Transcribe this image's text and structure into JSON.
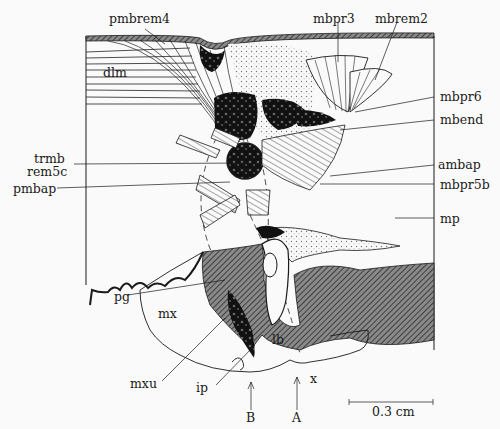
{
  "figure": {
    "type": "anatomical-diagram",
    "labels": {
      "pmbrem4": "pmbrem4",
      "mbpr3": "mbpr3",
      "mbrem2": "mbrem2",
      "dlm": "dlm",
      "mbpr6": "mbpr6",
      "mbend": "mbend",
      "trmb": "trmb",
      "rem5c": "rem5c",
      "ambap": "ambap",
      "pmbap": "pmbap",
      "mbpr5b": "mbpr5b",
      "mp": "mp",
      "pg": "pg",
      "mx": "mx",
      "lb": "lb",
      "mxu": "mxu",
      "ip": "ip",
      "x": "x",
      "B": "B",
      "A": "A"
    },
    "scale_bar": {
      "label": "0.3 cm"
    },
    "colors": {
      "ink": "#1a1a1a",
      "paper": "#fafafa",
      "hatch": "#555555"
    }
  }
}
